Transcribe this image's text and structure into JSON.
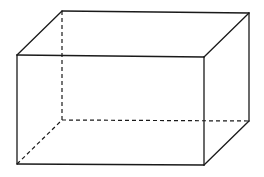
{
  "diagram": {
    "stroke_color": "#1a1a1a",
    "background": "#ffffff",
    "vertices": {
      "front_top_left": [
        17,
        55
      ],
      "front_top_right": [
        204,
        57
      ],
      "front_bottom_left": [
        17,
        164
      ],
      "front_bottom_right": [
        204,
        165
      ],
      "back_top_left": [
        62,
        11
      ],
      "back_top_right": [
        249,
        13
      ],
      "back_bottom_left": [
        62,
        120
      ],
      "back_bottom_right": [
        249,
        121
      ]
    },
    "solid_edges": 9,
    "hidden_edges": 3
  }
}
